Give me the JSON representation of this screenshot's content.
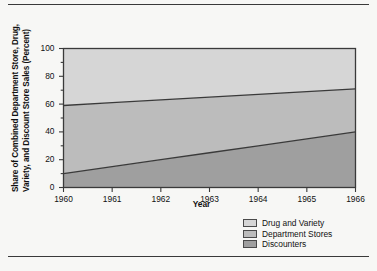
{
  "figure": {
    "has_top_rule": true,
    "has_bottom_rule": true
  },
  "chart_data": {
    "type": "area",
    "stacked": true,
    "title": "",
    "xlabel": "Year",
    "ylabel_line1": "Share of Combined Department Store, Drug,",
    "ylabel_line2": "Variety, and Discount Store Sales (Percent)",
    "x": [
      1960,
      1961,
      1962,
      1963,
      1964,
      1965,
      1966
    ],
    "xtick_labels": [
      "1960",
      "1961",
      "1962",
      "1963",
      "1964",
      "1965",
      "1966"
    ],
    "ytick_labels": [
      "0",
      "20",
      "40",
      "60",
      "80",
      "100"
    ],
    "ytick_values": [
      0,
      20,
      40,
      60,
      80,
      100
    ],
    "yminor_values": [
      10,
      30,
      50,
      70,
      90
    ],
    "xlim": [
      1960,
      1966
    ],
    "ylim": [
      0,
      100
    ],
    "grid": false,
    "legend_position": "bottom-right",
    "boundaries": {
      "discounters_top": [
        10,
        15,
        20,
        25,
        30,
        35,
        40
      ],
      "department_top": [
        59,
        61,
        63,
        65,
        67,
        69,
        71
      ]
    },
    "series": [
      {
        "name": "Discounters",
        "color": "#9f9f9f",
        "values": [
          10,
          15,
          20,
          25,
          30,
          35,
          40
        ]
      },
      {
        "name": "Department Stores",
        "color": "#bcbcbc",
        "values": [
          49,
          46,
          43,
          40,
          37,
          34,
          31
        ]
      },
      {
        "name": "Drug and Variety",
        "color": "#d6d6d6",
        "values": [
          41,
          39,
          37,
          35,
          33,
          31,
          29
        ]
      }
    ]
  },
  "legend": {
    "items": [
      {
        "label": "Drug and Variety",
        "color": "#d6d6d6"
      },
      {
        "label": "Department Stores",
        "color": "#bcbcbc"
      },
      {
        "label": "Discounters",
        "color": "#9f9f9f"
      }
    ]
  }
}
